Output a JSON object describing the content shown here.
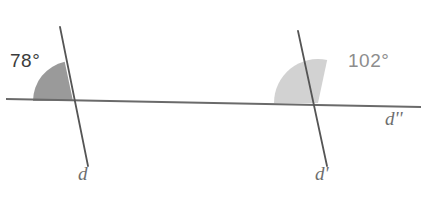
{
  "figure": {
    "width": 426,
    "height": 197,
    "background": "#ffffff"
  },
  "colors": {
    "background": "#ffffff",
    "line_stroke": "#555555",
    "horizontal_stroke": "#6a6a6a",
    "dark_sector_fill": "#9a9a9a",
    "light_sector_fill": "#d2d2d2",
    "angle_label_dark": "#3b3b3b",
    "angle_label_light": "#8d8d8d",
    "line_label": "#6e6e6e"
  },
  "angles": {
    "left": {
      "value": "78°",
      "degrees": 78,
      "fill": "#9a9a9a",
      "radius": 40,
      "vertex_x": 73,
      "vertex_y": 101,
      "start_deg": 180,
      "end_deg": 102
    },
    "right": {
      "value": "102°",
      "degrees": 102,
      "fill": "#d2d2d2",
      "radius": 44,
      "vertex_x": 318,
      "vertex_y": 103,
      "start_deg": 180,
      "end_deg": 78
    }
  },
  "lines": {
    "transversal_left": {
      "label": "d",
      "x1": 60,
      "y1": 27,
      "x2": 88,
      "y2": 166
    },
    "transversal_right": {
      "label": "d'",
      "x1": 298,
      "y1": 31,
      "x2": 327,
      "y2": 166
    },
    "horizontal": {
      "label": "d''",
      "x1": 6,
      "y1": 99,
      "x2": 421,
      "y2": 107
    }
  }
}
